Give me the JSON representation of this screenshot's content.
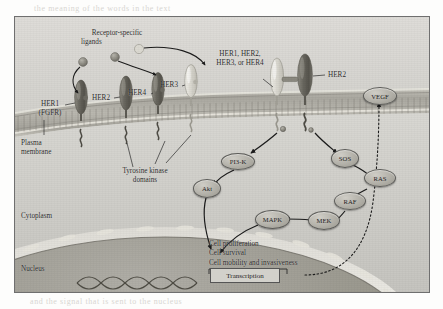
{
  "figure": {
    "compartments": [
      {
        "name": "plasma-membrane",
        "label": "Plasma\nmembrane"
      },
      {
        "name": "cytoplasm",
        "label": "Cytoplasm"
      },
      {
        "name": "nucleus",
        "label": "Nucleus"
      }
    ],
    "compartment_labels": {
      "plasma_membrane_line1": "Plasma",
      "plasma_membrane_line2": "membrane",
      "cytoplasm": "Cytoplasm",
      "nucleus": "Nucleus"
    },
    "annotations": {
      "ligands_line1": "Receptor-specific",
      "ligands_line2": "ligands",
      "dimer_line1": "HER1, HER2,",
      "dimer_line2": "HER3, or HER4",
      "tyrosine_line1": "Tyrosine kinase",
      "tyrosine_line2": "domains"
    },
    "receptors": [
      {
        "name": "her1",
        "label_line1": "HER1",
        "label_line2": "(FGFR)"
      },
      {
        "name": "her2-left",
        "label": "HER2"
      },
      {
        "name": "her4",
        "label": "HER4"
      },
      {
        "name": "her3",
        "label": "HER3"
      },
      {
        "name": "her2-right",
        "label": "HER2"
      }
    ],
    "nodes": [
      {
        "name": "pi3k",
        "label": "PI3-K"
      },
      {
        "name": "akt",
        "label": "Akt"
      },
      {
        "name": "sos",
        "label": "SOS"
      },
      {
        "name": "ras",
        "label": "RAS"
      },
      {
        "name": "raf",
        "label": "RAF"
      },
      {
        "name": "mek",
        "label": "MEK"
      },
      {
        "name": "mapk",
        "label": "MAPK"
      },
      {
        "name": "vegf",
        "label": "VEGF"
      }
    ],
    "outcomes": [
      "Cell proliferation",
      "Cell survival",
      "Cell mobility and invasiveness"
    ],
    "transcription_label": "Transcription"
  },
  "page_bleed": {
    "top": "the meaning of the words in the text",
    "bottom": "and the signal that is sent to the nucleus",
    "mid": "expression"
  },
  "colors": {
    "frame_border": "#6f6f6f",
    "extracellular": "#dcdbd7",
    "cytoplasm": "#d2d1cc",
    "nucleus": "#9e9c96",
    "membrane": "#b4b2aa",
    "receptor_dark": "#6e6c64",
    "receptor_light": "#d7d5cd",
    "node_fill": "#b2b0a8",
    "text": "#2b2b2b",
    "arrow": "#1c1c1c"
  }
}
